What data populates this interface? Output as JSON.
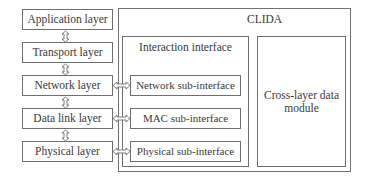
{
  "stack": {
    "layers": [
      {
        "label": "Application layer"
      },
      {
        "label": "Transport layer"
      },
      {
        "label": "Network layer"
      },
      {
        "label": "Data link layer"
      },
      {
        "label": "Physical layer"
      }
    ]
  },
  "clida": {
    "title": "CLIDA",
    "interaction_interface": {
      "title": "Interaction interface",
      "sub_interfaces": [
        {
          "label": "Network sub-interface"
        },
        {
          "label": "MAC sub-interface"
        },
        {
          "label": "Physical sub-interface"
        }
      ]
    },
    "cross_layer_module": {
      "label": "Cross-layer data module"
    }
  },
  "colors": {
    "border": "#6e6e6e",
    "text": "#3a3a3a",
    "background": "#ffffff"
  }
}
